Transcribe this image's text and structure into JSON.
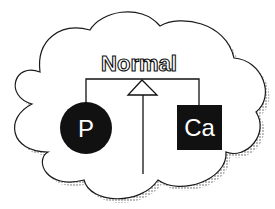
{
  "diagram": {
    "type": "cloud-hierarchy",
    "title": "Normal",
    "nodes": [
      {
        "id": "p",
        "label": "P",
        "shape": "circle",
        "fill": "#111111",
        "text_color": "#ffffff"
      },
      {
        "id": "ca",
        "label": "Ca",
        "shape": "square",
        "fill": "#111111",
        "text_color": "#ffffff"
      }
    ],
    "connectors": [
      {
        "from": "p",
        "to": "normal",
        "style": "bracket-line"
      },
      {
        "from": "ca",
        "to": "normal",
        "style": "bracket-line"
      },
      {
        "from": "bottom",
        "to": "normal",
        "style": "inheritance-arrow",
        "arrowhead": "hollow-triangle"
      }
    ],
    "container": {
      "shape": "cloud",
      "stroke": "#111111",
      "fill": "#ffffff",
      "shadow": "#bbbbbb"
    }
  }
}
